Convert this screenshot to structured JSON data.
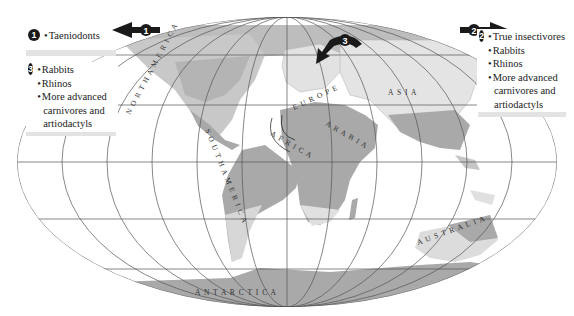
{
  "map": {
    "projection": "Mollweide-style world map with graticule",
    "colors": {
      "land_highlight": "#a9a9a9",
      "land_light": "#dcdcdc",
      "ocean": "#ffffff",
      "graticule": "#555555",
      "arrow": "#1a1a1a"
    },
    "labels": {
      "north_america": "N O R T H   A M E R I C A",
      "south_america": "S O U T H   A M E R I C A",
      "europe": "E U R O P E",
      "asia": "A S I A",
      "africa": "A F R I C A",
      "arabia": "A R A B I A",
      "australia": "A U S T R A L I A",
      "antarctica": "A N T A R C T I C A"
    },
    "arrows": [
      {
        "id": "1",
        "direction": "west"
      },
      {
        "id": "2",
        "direction": "east"
      },
      {
        "id": "3",
        "direction": "southwest"
      }
    ]
  },
  "legends": [
    {
      "number": "1",
      "items": [
        "Taeniodonts"
      ]
    },
    {
      "number": "3",
      "items": [
        "Rabbits",
        "Rhinos",
        "More advanced carnivores and artiodactyls"
      ]
    },
    {
      "number": "2",
      "items": [
        "True insectivores",
        "Rabbits",
        "Rhinos",
        "More advanced carnivores and artiodactyls"
      ]
    }
  ]
}
